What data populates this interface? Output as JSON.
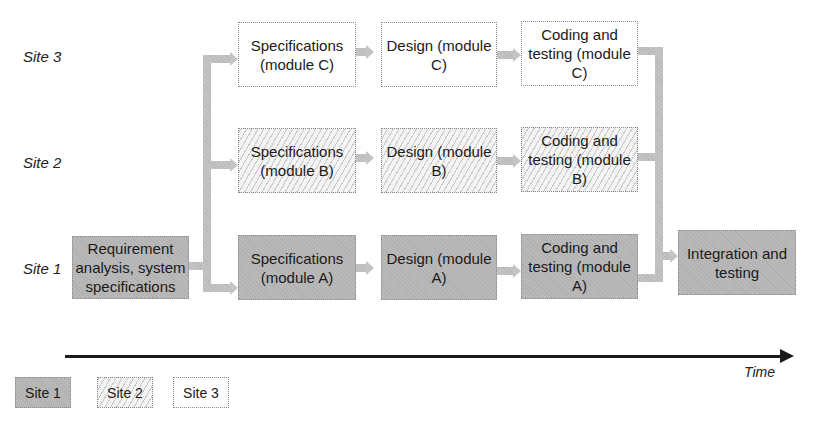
{
  "rows": {
    "site3": "Site 3",
    "site2": "Site 2",
    "site1": "Site 1"
  },
  "boxes": {
    "requirement": "Requirement analysis, system specifications",
    "spec_c": "Specifications (module C)",
    "design_c": "Design (module C)",
    "code_c": "Coding and testing (module C)",
    "spec_b": "Specifications (module B)",
    "design_b": "Design (module B)",
    "code_b": "Coding and testing (module B)",
    "spec_a": "Specifications (module A)",
    "design_a": "Design (module A)",
    "code_a": "Coding and testing (module A)",
    "integration": "Integration and testing"
  },
  "axis": {
    "label": "Time"
  },
  "legend": [
    {
      "label": "Site 1",
      "style": "gray-fill"
    },
    {
      "label": "Site 2",
      "style": "hatched"
    },
    {
      "label": "Site 3",
      "style": "white"
    }
  ],
  "colors": {
    "site1_fill": "#b9b9b9",
    "site2_fill": "#f4f4f4",
    "site3_fill": "#ffffff",
    "connector": "#c4c4c4",
    "timeline": "#1a1a1a"
  }
}
